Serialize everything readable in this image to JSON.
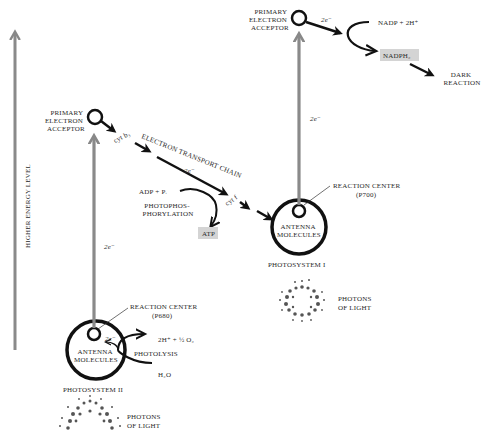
{
  "figure": {
    "energy_axis": {
      "label": "HIGHER ENERGY LEVEL"
    },
    "photosystem_ii": {
      "name": "PHOTOSYSTEM II",
      "antenna": [
        "ANTENNA",
        "MOLECULES"
      ],
      "reaction_center": [
        "REACTION CENTER",
        "(P680)"
      ],
      "primary_acceptor": [
        "PRIMARY",
        "ELECTRON",
        "ACCEPTOR"
      ],
      "electron_label": "2e⁻",
      "photolysis": {
        "label": "PHOTOLYSIS",
        "input": "H₂O",
        "output": "2H⁺ + ½ O₂",
        "electron_label": "2e⁻"
      },
      "photons": [
        "PHOTONS",
        "OF LIGHT"
      ]
    },
    "electron_transport_chain": {
      "label": "ELECTRON TRANSPORT CHAIN",
      "carriers": [
        "cyt b₃",
        "cyt f"
      ],
      "electron_label": "2e⁻",
      "photophosphorylation": {
        "label": [
          "PHOTOPHOS-",
          "PHORYLATION"
        ],
        "input": "ADP + Pᵢ",
        "output": "ATP"
      }
    },
    "photosystem_i": {
      "name": "PHOTOSYSTEM I",
      "antenna": [
        "ANTENNA",
        "MOLECULES"
      ],
      "reaction_center": [
        "REACTION CENTER",
        "(P700)"
      ],
      "primary_acceptor": [
        "PRIMARY",
        "ELECTRON",
        "ACCEPTOR"
      ],
      "electron_label": "2e⁻",
      "photons": [
        "PHOTONS",
        "OF LIGHT"
      ]
    },
    "nadp_reduction": {
      "electron_label": "2e⁻",
      "input": "NADP + 2H⁺",
      "output": "NADPH₂",
      "next": [
        "DARK",
        "REACTION"
      ]
    }
  }
}
